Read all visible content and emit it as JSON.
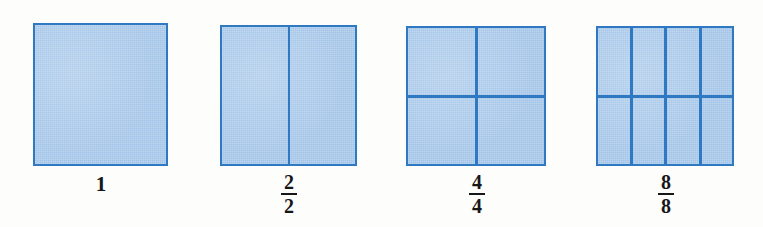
{
  "figure": {
    "background_color": "#fdfdfc",
    "fill_color": "#a2c4e8",
    "line_color": "#2f79c2",
    "text_color": "#17171a",
    "models": [
      {
        "id": "model-1",
        "label_type": "whole",
        "label": "1",
        "numerator": "1",
        "denominator": "1",
        "columns": 1,
        "rows": 1,
        "parts": 1,
        "shaded_parts": 1,
        "x": 33,
        "y": 23,
        "width": 135,
        "height": 143,
        "label_center_x": 101,
        "label_y": 174
      },
      {
        "id": "model-2",
        "label_type": "fraction",
        "label": "2/2",
        "numerator": "2",
        "denominator": "2",
        "columns": 2,
        "rows": 1,
        "parts": 2,
        "shaded_parts": 2,
        "x": 220,
        "y": 25,
        "width": 137,
        "height": 141,
        "label_center_x": 289,
        "label_y": 172
      },
      {
        "id": "model-3",
        "label_type": "fraction",
        "label": "4/4",
        "numerator": "4",
        "denominator": "4",
        "columns": 2,
        "rows": 2,
        "parts": 4,
        "shaded_parts": 4,
        "x": 406,
        "y": 26,
        "width": 140,
        "height": 140,
        "label_center_x": 477,
        "label_y": 172
      },
      {
        "id": "model-4",
        "label_type": "fraction",
        "label": "8/8",
        "numerator": "8",
        "denominator": "8",
        "columns": 4,
        "rows": 2,
        "parts": 8,
        "shaded_parts": 8,
        "x": 596,
        "y": 26,
        "width": 138,
        "height": 140,
        "label_center_x": 666,
        "label_y": 172
      }
    ]
  }
}
